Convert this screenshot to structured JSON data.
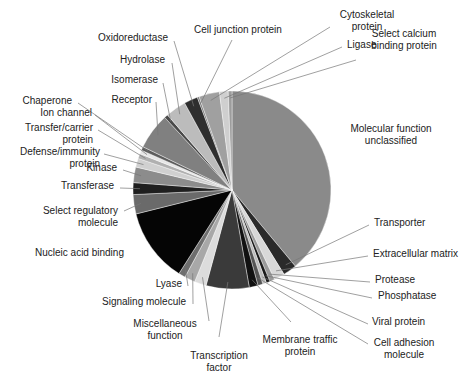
{
  "chart_data": {
    "type": "pie",
    "title": "",
    "start": "top",
    "direction": "clockwise",
    "unit": "percent",
    "slices": [
      {
        "label": "Molecular function unclassified",
        "value": 38.3,
        "color": "#8a8a8a"
      },
      {
        "label": "Transporter",
        "value": 2.2,
        "color": "#2a2a2a"
      },
      {
        "label": "Extracellular matrix",
        "value": 1.7,
        "color": "#d8d8d8"
      },
      {
        "label": "Protease",
        "value": 0.8,
        "color": "#9a9a9a"
      },
      {
        "label": "Phosphatase",
        "value": 0.6,
        "color": "#1a1a1a"
      },
      {
        "label": "Viral protein",
        "value": 0.6,
        "color": "#bdbdbd"
      },
      {
        "label": "Cell adhesion molecule",
        "value": 0.8,
        "color": "#555555"
      },
      {
        "label": "Membrane traffic protein",
        "value": 1.4,
        "color": "#111111"
      },
      {
        "label": "Transcription factor",
        "value": 6.9,
        "color": "#3a3a3a"
      },
      {
        "label": "Miscellaneous function",
        "value": 1.9,
        "color": "#dcdcdc"
      },
      {
        "label": "Signaling molecule",
        "value": 1.7,
        "color": "#a8a8a8"
      },
      {
        "label": "Lyase",
        "value": 1.1,
        "color": "#6e6e6e"
      },
      {
        "label": "Nucleic acid binding",
        "value": 11.9,
        "color": "#050505"
      },
      {
        "label": "Select regulatory molecule",
        "value": 3.1,
        "color": "#6a6a6a"
      },
      {
        "label": "Transferase",
        "value": 1.9,
        "color": "#1f1f1f"
      },
      {
        "label": "Kinase",
        "value": 2.5,
        "color": "#8c8c8c"
      },
      {
        "label": "Defense/immunity protein",
        "value": 1.4,
        "color": "#d0d0d0"
      },
      {
        "label": "Transfer/carrier protein",
        "value": 0.8,
        "color": "#b0b0b0"
      },
      {
        "label": "Ion channel",
        "value": 0.6,
        "color": "#e6e6e6"
      },
      {
        "label": "Chaperone",
        "value": 0.6,
        "color": "#5c5c5c"
      },
      {
        "label": "Receptor",
        "value": 5.8,
        "color": "#808080"
      },
      {
        "label": "Isomerase",
        "value": 0.6,
        "color": "#4a4a4a"
      },
      {
        "label": "Hydrolase",
        "value": 3.3,
        "color": "#bcbcbc"
      },
      {
        "label": "Oxidoreductase",
        "value": 2.2,
        "color": "#2e2e2e"
      },
      {
        "label": "Cell junction protein",
        "value": 0.3,
        "color": "#777777"
      },
      {
        "label": "Cytoskeletal protein",
        "value": 3.3,
        "color": "#a0a0a0"
      },
      {
        "label": "Ligase",
        "value": 1.4,
        "color": "#cfcfcf"
      },
      {
        "label": "Select calcium binding protein",
        "value": 0.6,
        "color": "#9c9c9c"
      }
    ]
  },
  "labels": {
    "molecular_function_unclassified": [
      "Molecular function",
      "unclassified"
    ],
    "transporter": [
      "Transporter"
    ],
    "extracellular_matrix": [
      "Extracellular matrix"
    ],
    "protease": [
      "Protease"
    ],
    "phosphatase": [
      "Phosphatase"
    ],
    "viral_protein": [
      "Viral protein"
    ],
    "cell_adhesion_molecule": [
      "Cell adhesion",
      "molecule"
    ],
    "membrane_traffic_protein": [
      "Membrane traffic",
      "protein"
    ],
    "transcription_factor": [
      "Transcription",
      "factor"
    ],
    "miscellaneous_function": [
      "Miscellaneous",
      "function"
    ],
    "signaling_molecule": [
      "Signaling molecule"
    ],
    "lyase": [
      "Lyase"
    ],
    "nucleic_acid_binding": [
      "Nucleic acid binding"
    ],
    "select_regulatory_molecule": [
      "Select regulatory",
      "molecule"
    ],
    "transferase": [
      "Transferase"
    ],
    "kinase": [
      "Kinase"
    ],
    "defense_immunity_protein": [
      "Defense/immunity",
      "protein"
    ],
    "transfer_carrier_protein": [
      "Transfer/carrier",
      "protein"
    ],
    "ion_channel": [
      "Ion channel"
    ],
    "chaperone": [
      "Chaperone"
    ],
    "receptor": [
      "Receptor"
    ],
    "isomerase": [
      "Isomerase"
    ],
    "hydrolase": [
      "Hydrolase"
    ],
    "oxidoreductase": [
      "Oxidoreductase"
    ],
    "cell_junction_protein": [
      "Cell junction protein"
    ],
    "cytoskeletal_protein": [
      "Cytoskeletal",
      "protein"
    ],
    "ligase": [
      "Ligase"
    ],
    "select_calcium_binding_protein": [
      "Select calcium",
      "binding protein"
    ]
  }
}
